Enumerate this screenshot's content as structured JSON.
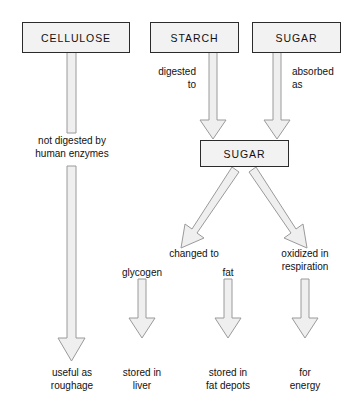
{
  "diagram": {
    "title_nodes": [
      {
        "id": "cellulose",
        "label": "CELLULOSE"
      },
      {
        "id": "starch",
        "label": "STARCH"
      },
      {
        "id": "sugar_top",
        "label": "SUGAR"
      },
      {
        "id": "sugar_mid",
        "label": "SUGAR"
      }
    ],
    "edge_labels": [
      {
        "id": "digested-to",
        "text": "digested\nto"
      },
      {
        "id": "absorbed-as",
        "text": "absorbed\nas"
      },
      {
        "id": "not-digested",
        "text": "not digested by\nhuman enzymes"
      },
      {
        "id": "changed-to",
        "text": "changed to"
      },
      {
        "id": "oxidized-in-respiration",
        "text": "oxidized in\nrespiration"
      },
      {
        "id": "glycogen",
        "text": "glycogen"
      },
      {
        "id": "fat",
        "text": "fat"
      }
    ],
    "outcomes": [
      {
        "id": "roughage",
        "text": "useful as\nroughage"
      },
      {
        "id": "liver",
        "text": "stored in\nliver"
      },
      {
        "id": "fat-depots",
        "text": "stored in\nfat depots"
      },
      {
        "id": "energy",
        "text": "for\nenergy"
      }
    ],
    "colors": {
      "box_fill": "#f2f2f2",
      "box_border": "#2b2b2b",
      "arrow_fill": "#efefef",
      "arrow_border": "#9a9a9a",
      "text": "#111111",
      "background": "#ffffff"
    }
  }
}
